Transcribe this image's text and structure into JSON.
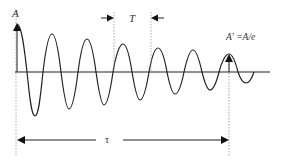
{
  "diagram": {
    "labels": {
      "amplitude": "A",
      "period": "T",
      "decayed_amplitude": "A' =A/e",
      "decay_time": "τ"
    },
    "colors": {
      "curve": "#222222",
      "axis": "#222222",
      "guide": "#9a9a9a"
    }
  }
}
